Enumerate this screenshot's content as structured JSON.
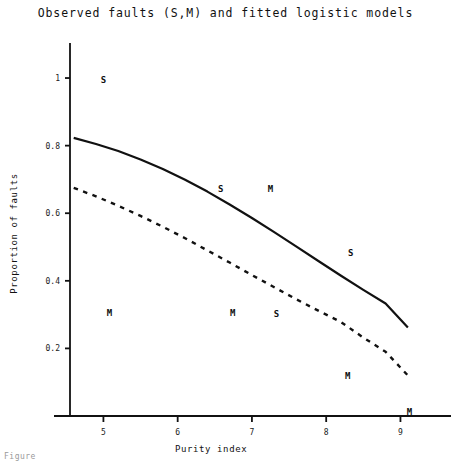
{
  "figure": {
    "title": "Observed faults (S,M) and fitted logistic models",
    "caption": "Figure"
  },
  "chart_data": {
    "type": "line",
    "title": "Observed faults (S,M) and fitted logistic models",
    "xlabel": "Purity index",
    "ylabel": "Proportion of faults",
    "xlim": [
      4.55,
      9.6
    ],
    "ylim": [
      0,
      1.08
    ],
    "xticks": [
      5,
      6,
      7,
      8,
      9
    ],
    "xtick_labels": [
      "5",
      "6",
      "7",
      "8",
      "9"
    ],
    "yticks": [
      0.2,
      0.4,
      0.6,
      0.8,
      1
    ],
    "ytick_labels": [
      "0.2",
      "0.4",
      "0.6",
      "0.8",
      "1"
    ],
    "grid": false,
    "legend": "none",
    "series": [
      {
        "name": "fitted logistic model S",
        "style": "solid",
        "color": "#111111",
        "x": [
          4.6,
          4.9,
          5.2,
          5.5,
          5.8,
          6.1,
          6.4,
          6.7,
          7.0,
          7.3,
          7.6,
          7.9,
          8.2,
          8.5,
          8.8,
          9.1
        ],
        "y": [
          0.823,
          0.805,
          0.784,
          0.759,
          0.731,
          0.699,
          0.664,
          0.626,
          0.586,
          0.544,
          0.501,
          0.458,
          0.415,
          0.373,
          0.333,
          0.262
        ]
      },
      {
        "name": "fitted logistic model M",
        "style": "dashed",
        "color": "#111111",
        "x": [
          4.6,
          4.9,
          5.2,
          5.5,
          5.8,
          6.1,
          6.4,
          6.7,
          7.0,
          7.3,
          7.6,
          7.9,
          8.2,
          8.5,
          8.8,
          9.1
        ],
        "y": [
          0.675,
          0.65,
          0.622,
          0.592,
          0.56,
          0.526,
          0.49,
          0.454,
          0.417,
          0.381,
          0.345,
          0.311,
          0.278,
          0.232,
          0.19,
          0.12
        ]
      }
    ],
    "observed_points": [
      {
        "label": "S",
        "x": 5.0,
        "y": 0.995
      },
      {
        "label": "S",
        "x": 6.58,
        "y": 0.672
      },
      {
        "label": "M",
        "x": 7.25,
        "y": 0.672
      },
      {
        "label": "S",
        "x": 8.33,
        "y": 0.485
      },
      {
        "label": "M",
        "x": 5.08,
        "y": 0.305
      },
      {
        "label": "M",
        "x": 6.74,
        "y": 0.305
      },
      {
        "label": "S",
        "x": 7.33,
        "y": 0.302
      },
      {
        "label": "M",
        "x": 8.29,
        "y": 0.12
      },
      {
        "label": "M",
        "x": 9.12,
        "y": 0.012
      }
    ]
  }
}
